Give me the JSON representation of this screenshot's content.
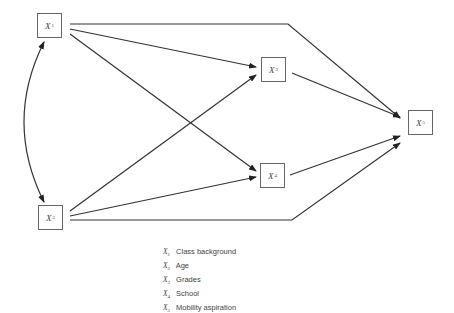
{
  "nodes": [
    {
      "id": "X1",
      "var": "X",
      "sub": "1",
      "label": "Class background"
    },
    {
      "id": "X2",
      "var": "X",
      "sub": "2",
      "label": "Age"
    },
    {
      "id": "X3",
      "var": "X",
      "sub": "3",
      "label": "Grades"
    },
    {
      "id": "X4",
      "var": "X",
      "sub": "4",
      "label": "School"
    },
    {
      "id": "X5",
      "var": "X",
      "sub": "5",
      "label": "Mobility aspiration"
    }
  ],
  "edges": [
    {
      "from": "X1",
      "to": "X5",
      "type": "directed"
    },
    {
      "from": "X1",
      "to": "X3",
      "type": "directed"
    },
    {
      "from": "X1",
      "to": "X4",
      "type": "directed"
    },
    {
      "from": "X2",
      "to": "X3",
      "type": "directed"
    },
    {
      "from": "X2",
      "to": "X4",
      "type": "directed"
    },
    {
      "from": "X2",
      "to": "X5",
      "type": "directed"
    },
    {
      "from": "X3",
      "to": "X5",
      "type": "directed"
    },
    {
      "from": "X4",
      "to": "X5",
      "type": "directed"
    },
    {
      "from": "X1",
      "to": "X2",
      "type": "bidirectional-curved"
    }
  ],
  "colors": {
    "line": "#333333",
    "box": "#666666"
  }
}
